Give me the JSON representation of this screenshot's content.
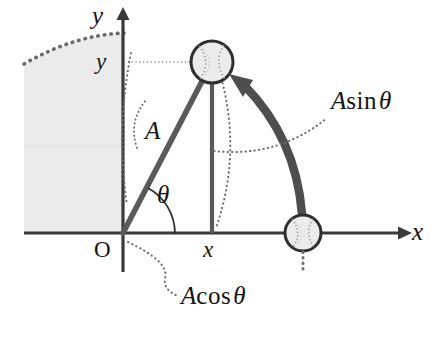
{
  "axes": {
    "x_axis_label": "x",
    "y_axis_label": "y",
    "origin_label": "O",
    "x_tick_label": "x",
    "y_tick_label": "y",
    "axis_color": "#3a3a3a"
  },
  "labels": {
    "amplitude": "A",
    "angle": "θ",
    "a_sin_theta_A": "A",
    "a_sin_theta_fn": "sin",
    "a_sin_theta_arg": "θ",
    "a_cos_theta_A": "A",
    "a_cos_theta_fn": "cos",
    "a_cos_theta_arg": "θ"
  },
  "colors": {
    "shaded_region": "#ebebeb",
    "radius_line": "#5a5a5a",
    "drop_line": "#5a5a5a",
    "motion_arrow": "#4e4e4e",
    "dotted_guide": "#6e6e6e",
    "ball_fill": "#e6e6e6",
    "ball_stroke": "#2e2e2e",
    "text": "#131313"
  },
  "geometry": {
    "origin_x": 123,
    "origin_y": 233,
    "radius_A": 195,
    "theta_degrees": 61,
    "ball_top_center_x": 212,
    "ball_top_center_y": 62,
    "ball_top_radius": 21,
    "ball_bottom_center_x": 303,
    "ball_bottom_center_y": 233,
    "ball_bottom_radius": 18
  },
  "elements": {
    "shaded_region_name": "shaded-background-region",
    "dotted_arc_name": "dotted-upper-arc",
    "ball_top_name": "ball-at-angle",
    "ball_bottom_name": "ball-at-x-axis",
    "motion_arrow_name": "curved-motion-arrow"
  }
}
